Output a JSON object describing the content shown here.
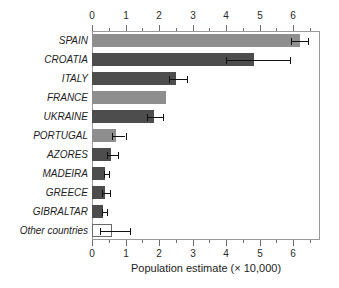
{
  "chart_data": {
    "type": "bar",
    "orientation": "horizontal",
    "title": "",
    "subtitle": "",
    "xlabel": "Population estimate (× 10,000)",
    "ylabel": "",
    "xlim": [
      0,
      7.1
    ],
    "grid": false,
    "legend": null,
    "top_axis": true,
    "bottom_axis": true,
    "xticks": [
      0,
      1,
      2,
      3,
      4,
      5,
      6
    ],
    "xtick_labels": [
      "0",
      "1",
      "2",
      "3",
      "4",
      "5",
      "6"
    ],
    "minor_tick_step": 0.5,
    "categories": [
      "SPAIN",
      "CROATIA",
      "ITALY",
      "FRANCE",
      "UKRAINE",
      "PORTUGAL",
      "AZORES",
      "MADEIRA",
      "GREECE",
      "GIBRALTAR",
      "Other countries"
    ],
    "values": [
      6.2,
      4.85,
      2.5,
      2.2,
      1.85,
      0.72,
      0.57,
      0.4,
      0.38,
      0.33,
      0.6
    ],
    "error_low": [
      5.95,
      4.0,
      2.3,
      null,
      1.65,
      0.6,
      0.45,
      0.35,
      0.3,
      0.3,
      0.25
    ],
    "error_high": [
      6.45,
      5.9,
      2.85,
      null,
      2.12,
      1.0,
      0.78,
      0.52,
      0.55,
      0.46,
      1.12
    ],
    "bar_colors": [
      "#8e8e8e",
      "#4d4d4d",
      "#4d4d4d",
      "#8e8e8e",
      "#4d4d4d",
      "#8e8e8e",
      "#4d4d4d",
      "#4d4d4d",
      "#4d4d4d",
      "#4d4d4d",
      "#ffffff"
    ],
    "bar_styles": [
      "light",
      "dark",
      "dark",
      "light",
      "dark",
      "light",
      "dark",
      "dark",
      "dark",
      "dark",
      "hollow"
    ]
  },
  "colors": {
    "light_gray": "#8e8e8e",
    "dark_gray": "#4d4d4d",
    "hollow_outline": "#6b6b6b",
    "axis": "#9a9a9a",
    "text": "#1d1d1d",
    "background": "#ffffff"
  }
}
